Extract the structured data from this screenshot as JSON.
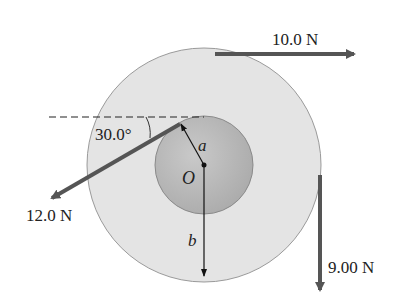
{
  "diagram": {
    "type": "physics-free-body",
    "colors": {
      "outer_disk": "#e4e4e4",
      "inner_disk": "#bdbdbd",
      "force_arrow": "#555555",
      "dimension_line": "#111111",
      "background": "#ffffff"
    },
    "labels": {
      "center": "O",
      "inner_radius": "a",
      "outer_radius": "b",
      "angle": "30.0°",
      "force_top": "10.0 N",
      "force_left": "12.0 N",
      "force_right": "9.00 N"
    },
    "forces": [
      {
        "name": "top",
        "magnitude": "10.0 N",
        "direction": "right",
        "applied_at": "top of outer cylinder"
      },
      {
        "name": "left",
        "magnitude": "12.0 N",
        "direction": "30.0° below horizontal, pointing left",
        "applied_at": "top of inner cylinder"
      },
      {
        "name": "right",
        "magnitude": "9.00 N",
        "direction": "down",
        "applied_at": "right side of outer cylinder"
      }
    ]
  }
}
